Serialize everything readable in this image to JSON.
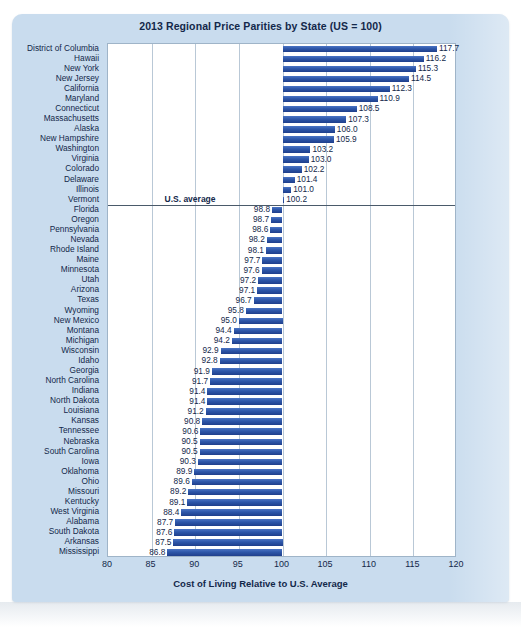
{
  "chart_data": {
    "type": "bar",
    "orientation": "horizontal",
    "title": "2013 Regional Price Parities by State (US = 100)",
    "xlabel": "Cost of Living Relative to U.S. Average",
    "ylabel": "",
    "xlim": [
      80,
      120
    ],
    "xticks": [
      80,
      85,
      90,
      95,
      100,
      105,
      110,
      115,
      120
    ],
    "grid": true,
    "baseline": 100,
    "annotations": [
      {
        "text": "U.S. average",
        "value": 100,
        "position": "between Vermont and Florida"
      }
    ],
    "legend": null,
    "bar_color": "#2d56a8",
    "categories": [
      "District of Columbia",
      "Hawaii",
      "New York",
      "New Jersey",
      "California",
      "Maryland",
      "Connecticut",
      "Massachusetts",
      "Alaska",
      "New Hampshire",
      "Washington",
      "Virginia",
      "Colorado",
      "Delaware",
      "Illinois",
      "Vermont",
      "Florida",
      "Oregon",
      "Pennsylvania",
      "Nevada",
      "Rhode Island",
      "Maine",
      "Minnesota",
      "Utah",
      "Arizona",
      "Texas",
      "Wyoming",
      "New Mexico",
      "Montana",
      "Michigan",
      "Wisconsin",
      "Idaho",
      "Georgia",
      "North Carolina",
      "Indiana",
      "North Dakota",
      "Louisiana",
      "Kansas",
      "Tennessee",
      "Nebraska",
      "South Carolina",
      "Iowa",
      "Oklahoma",
      "Ohio",
      "Missouri",
      "Kentucky",
      "West Virginia",
      "Alabama",
      "South Dakota",
      "Arkansas",
      "Mississippi"
    ],
    "values": [
      117.7,
      116.2,
      115.3,
      114.5,
      112.3,
      110.9,
      108.5,
      107.3,
      106.0,
      105.9,
      103.2,
      103.0,
      102.2,
      101.4,
      101.0,
      100.2,
      98.8,
      98.7,
      98.6,
      98.2,
      98.1,
      97.7,
      97.6,
      97.2,
      97.1,
      96.7,
      95.8,
      95.0,
      94.4,
      94.2,
      92.9,
      92.8,
      91.9,
      91.7,
      91.4,
      91.4,
      91.2,
      90.8,
      90.6,
      90.5,
      90.5,
      90.3,
      89.9,
      89.6,
      89.2,
      89.1,
      88.4,
      87.7,
      87.6,
      87.5,
      86.8
    ],
    "value_labels": [
      "117.7",
      "116.2",
      "115.3",
      "114.5",
      "112.3",
      "110.9",
      "108.5",
      "107.3",
      "106.0",
      "105.9",
      "103.2",
      "103.0",
      "102.2",
      "101.4",
      "101.0",
      "100.2",
      "98.8",
      "98.7",
      "98.6",
      "98.2",
      "98.1",
      "97.7",
      "97.6",
      "97.2",
      "97.1",
      "96.7",
      "95.8",
      "95.0",
      "94.4",
      "94.2",
      "92.9",
      "92.8",
      "91.9",
      "91.7",
      "91.4",
      "91.4",
      "91.2",
      "90.8",
      "90.6",
      "90.5",
      "90.5",
      "90.3",
      "89.9",
      "89.6",
      "89.2",
      "89.1",
      "88.4",
      "87.7",
      "87.6",
      "87.5",
      "86.8"
    ]
  }
}
